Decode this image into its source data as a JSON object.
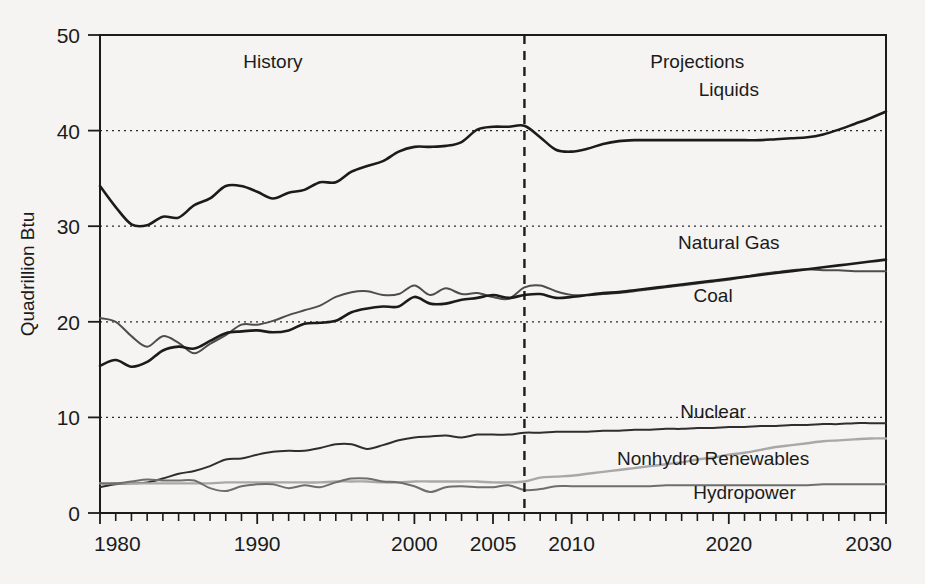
{
  "chart_data": {
    "type": "line",
    "title": "",
    "xlabel": "",
    "ylabel": "Quadrillion Btu",
    "xlim": [
      1980,
      2030
    ],
    "ylim": [
      0,
      50
    ],
    "yticks": [
      0,
      10,
      20,
      30,
      40,
      50
    ],
    "ytick_labels": [
      "0",
      "10",
      "20",
      "30",
      "40",
      "50"
    ],
    "xticks": [
      1980,
      1990,
      2000,
      2005,
      2010,
      2020,
      2030
    ],
    "xtick_labels": [
      "1980",
      "1990",
      "2000",
      "2005",
      "2010",
      "2020",
      "2030"
    ],
    "grid": "horizontal dotted gridlines at 10, 20, 30, 40",
    "legend_position": "inline end-of-line labels",
    "annotations": [
      {
        "text": "History",
        "x": 1991,
        "y": 46.5
      },
      {
        "text": "Projections",
        "x": 2018,
        "y": 46.5
      }
    ],
    "divider": {
      "x": 2007,
      "style": "dashed vertical",
      "label": "history/projections boundary"
    },
    "series": [
      {
        "name": "Liquids",
        "color": "#1b1b1b",
        "width": 2.6,
        "label_x": 2020,
        "label_y": 43.6,
        "x": [
          1980,
          1981,
          1982,
          1983,
          1984,
          1985,
          1986,
          1987,
          1988,
          1989,
          1990,
          1991,
          1992,
          1993,
          1994,
          1995,
          1996,
          1997,
          1998,
          1999,
          2000,
          2001,
          2002,
          2003,
          2004,
          2005,
          2006,
          2007,
          2008,
          2009,
          2010,
          2011,
          2012,
          2013,
          2014,
          2015,
          2016,
          2017,
          2018,
          2019,
          2020,
          2021,
          2022,
          2023,
          2024,
          2025,
          2026,
          2027,
          2028,
          2029,
          2030
        ],
        "y": [
          34.2,
          32.0,
          30.2,
          30.1,
          31.0,
          30.9,
          32.2,
          32.9,
          34.2,
          34.2,
          33.6,
          32.9,
          33.5,
          33.8,
          34.6,
          34.6,
          35.7,
          36.3,
          36.8,
          37.8,
          38.3,
          38.3,
          38.4,
          38.8,
          40.1,
          40.4,
          40.4,
          40.5,
          39.3,
          38.0,
          37.8,
          38.1,
          38.6,
          38.9,
          39.0,
          39.0,
          39.0,
          39.0,
          39.0,
          39.0,
          39.0,
          39.0,
          39.0,
          39.1,
          39.2,
          39.3,
          39.6,
          40.1,
          40.7,
          41.3,
          42.0
        ]
      },
      {
        "name": "Natural Gas",
        "color": "#4d4d4d",
        "width": 2.0,
        "label_x": 2020,
        "label_y": 27.6,
        "x": [
          1980,
          1981,
          1982,
          1983,
          1984,
          1985,
          1986,
          1987,
          1988,
          1989,
          1990,
          1991,
          1992,
          1993,
          1994,
          1995,
          1996,
          1997,
          1998,
          1999,
          2000,
          2001,
          2002,
          2003,
          2004,
          2005,
          2006,
          2007,
          2008,
          2009,
          2010,
          2011,
          2012,
          2013,
          2014,
          2015,
          2016,
          2017,
          2018,
          2019,
          2020,
          2021,
          2022,
          2023,
          2024,
          2025,
          2026,
          2027,
          2028,
          2029,
          2030
        ],
        "y": [
          20.4,
          20.0,
          18.5,
          17.4,
          18.5,
          17.8,
          16.7,
          17.7,
          18.6,
          19.7,
          19.7,
          20.1,
          20.7,
          21.2,
          21.7,
          22.6,
          23.1,
          23.2,
          22.8,
          22.9,
          23.8,
          22.8,
          23.5,
          22.9,
          23.0,
          22.6,
          22.4,
          23.6,
          23.8,
          23.2,
          22.8,
          22.8,
          22.9,
          23.0,
          23.2,
          23.4,
          23.6,
          23.8,
          24.0,
          24.2,
          24.4,
          24.7,
          25.0,
          25.2,
          25.4,
          25.5,
          25.4,
          25.4,
          25.3,
          25.3,
          25.3
        ]
      },
      {
        "name": "Coal",
        "color": "#1b1b1b",
        "width": 2.6,
        "label_x": 2019,
        "label_y": 22.1,
        "x": [
          1980,
          1981,
          1982,
          1983,
          1984,
          1985,
          1986,
          1987,
          1988,
          1989,
          1990,
          1991,
          1992,
          1993,
          1994,
          1995,
          1996,
          1997,
          1998,
          1999,
          2000,
          2001,
          2002,
          2003,
          2004,
          2005,
          2006,
          2007,
          2008,
          2009,
          2010,
          2011,
          2012,
          2013,
          2014,
          2015,
          2016,
          2017,
          2018,
          2019,
          2020,
          2021,
          2022,
          2023,
          2024,
          2025,
          2026,
          2027,
          2028,
          2029,
          2030
        ],
        "y": [
          15.4,
          16.0,
          15.3,
          15.8,
          17.0,
          17.4,
          17.2,
          18.0,
          18.8,
          19.0,
          19.1,
          18.9,
          19.1,
          19.8,
          19.9,
          20.1,
          21.0,
          21.4,
          21.6,
          21.6,
          22.6,
          21.9,
          21.9,
          22.3,
          22.5,
          22.8,
          22.5,
          22.8,
          22.9,
          22.5,
          22.6,
          22.8,
          23.0,
          23.1,
          23.3,
          23.5,
          23.7,
          23.9,
          24.1,
          24.3,
          24.5,
          24.7,
          24.9,
          25.1,
          25.3,
          25.5,
          25.7,
          25.9,
          26.1,
          26.3,
          26.5
        ]
      },
      {
        "name": "Nuclear",
        "color": "#2e2e2e",
        "width": 2.0,
        "label_x": 2019,
        "label_y": 9.9,
        "x": [
          1980,
          1981,
          1982,
          1983,
          1984,
          1985,
          1986,
          1987,
          1988,
          1989,
          1990,
          1991,
          1992,
          1993,
          1994,
          1995,
          1996,
          1997,
          1998,
          1999,
          2000,
          2001,
          2002,
          2003,
          2004,
          2005,
          2006,
          2007,
          2008,
          2009,
          2010,
          2011,
          2012,
          2013,
          2014,
          2015,
          2016,
          2017,
          2018,
          2019,
          2020,
          2021,
          2022,
          2023,
          2024,
          2025,
          2026,
          2027,
          2028,
          2029,
          2030
        ],
        "y": [
          2.7,
          3.0,
          3.1,
          3.2,
          3.6,
          4.1,
          4.4,
          4.9,
          5.6,
          5.7,
          6.1,
          6.4,
          6.5,
          6.5,
          6.8,
          7.2,
          7.2,
          6.7,
          7.1,
          7.6,
          7.9,
          8.0,
          8.1,
          7.9,
          8.2,
          8.2,
          8.2,
          8.4,
          8.4,
          8.5,
          8.5,
          8.5,
          8.6,
          8.6,
          8.7,
          8.7,
          8.8,
          8.8,
          8.9,
          8.9,
          9.0,
          9.0,
          9.1,
          9.1,
          9.2,
          9.2,
          9.3,
          9.3,
          9.4,
          9.4,
          9.4
        ]
      },
      {
        "name": "Nonhydro Renewables",
        "color": "#a8a8a8",
        "width": 2.4,
        "label_x": 2019,
        "label_y": 5.0,
        "x": [
          1980,
          1981,
          1982,
          1983,
          1984,
          1985,
          1986,
          1987,
          1988,
          1989,
          1990,
          1991,
          1992,
          1993,
          1994,
          1995,
          1996,
          1997,
          1998,
          1999,
          2000,
          2001,
          2002,
          2003,
          2004,
          2005,
          2006,
          2007,
          2008,
          2009,
          2010,
          2011,
          2012,
          2013,
          2014,
          2015,
          2016,
          2017,
          2018,
          2019,
          2020,
          2021,
          2022,
          2023,
          2024,
          2025,
          2026,
          2027,
          2028,
          2029,
          2030
        ],
        "y": [
          3.1,
          3.1,
          3.1,
          3.1,
          3.1,
          3.1,
          3.1,
          3.1,
          3.2,
          3.2,
          3.2,
          3.2,
          3.2,
          3.2,
          3.2,
          3.3,
          3.3,
          3.3,
          3.2,
          3.2,
          3.3,
          3.3,
          3.3,
          3.3,
          3.3,
          3.2,
          3.2,
          3.3,
          3.7,
          3.8,
          3.9,
          4.1,
          4.3,
          4.5,
          4.7,
          4.9,
          5.1,
          5.3,
          5.6,
          5.8,
          6.1,
          6.3,
          6.6,
          6.9,
          7.1,
          7.3,
          7.5,
          7.6,
          7.7,
          7.8,
          7.8
        ]
      },
      {
        "name": "Hydropower",
        "color": "#6e6e6e",
        "width": 2.0,
        "label_x": 2021,
        "label_y": 1.5,
        "x": [
          1980,
          1981,
          1982,
          1983,
          1984,
          1985,
          1986,
          1987,
          1988,
          1989,
          1990,
          1991,
          1992,
          1993,
          1994,
          1995,
          1996,
          1997,
          1998,
          1999,
          2000,
          2001,
          2002,
          2003,
          2004,
          2005,
          2006,
          2007,
          2008,
          2009,
          2010,
          2011,
          2012,
          2013,
          2014,
          2015,
          2016,
          2017,
          2018,
          2019,
          2020,
          2021,
          2022,
          2023,
          2024,
          2025,
          2026,
          2027,
          2028,
          2029,
          2030
        ],
        "y": [
          3.1,
          3.1,
          3.3,
          3.5,
          3.4,
          3.4,
          3.4,
          2.6,
          2.3,
          2.8,
          3.0,
          3.0,
          2.6,
          2.9,
          2.7,
          3.2,
          3.6,
          3.6,
          3.3,
          3.2,
          2.8,
          2.2,
          2.7,
          2.8,
          2.7,
          2.7,
          2.9,
          2.4,
          2.5,
          2.8,
          2.8,
          2.8,
          2.8,
          2.8,
          2.8,
          2.8,
          2.9,
          2.9,
          2.9,
          2.9,
          2.9,
          2.9,
          2.9,
          2.9,
          2.9,
          2.9,
          3.0,
          3.0,
          3.0,
          3.0,
          3.0
        ]
      }
    ]
  }
}
